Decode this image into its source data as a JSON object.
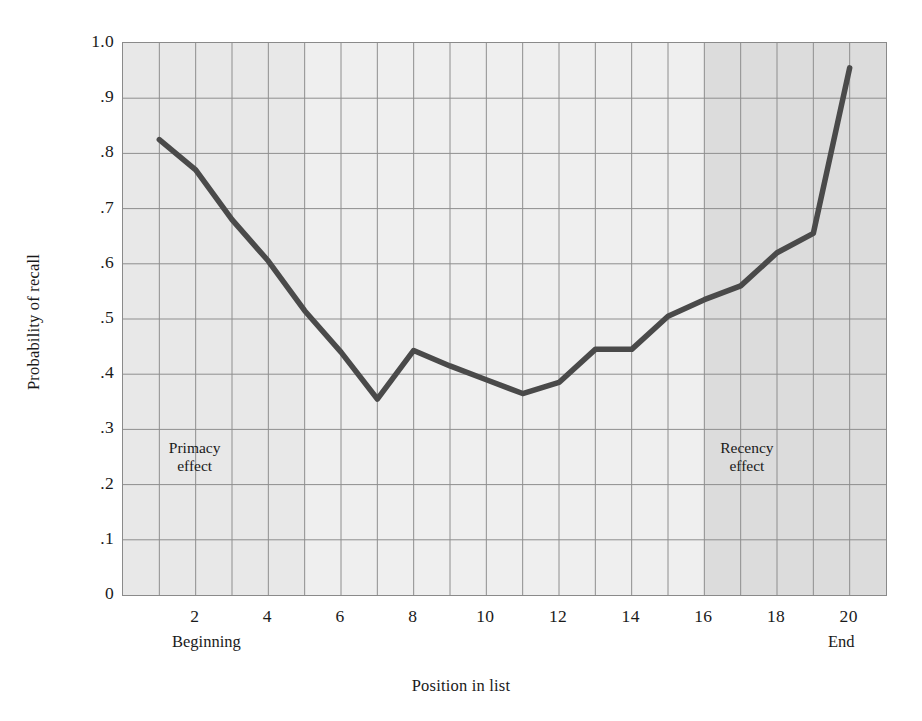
{
  "figure": {
    "background_color": "#ffffff",
    "plot_border_color": "#8a8a8a",
    "grid_color": "#8e8e8e",
    "line_color": "#4a4a4a"
  },
  "axes": {
    "y_title": "Probability of recall",
    "x_title": "Position in list",
    "y_ticks": [
      "1.0",
      ".9",
      ".8",
      ".7",
      ".6",
      ".5",
      ".4",
      ".3",
      ".2",
      ".1",
      "0"
    ],
    "y_tick_values": [
      1.0,
      0.9,
      0.8,
      0.7,
      0.6,
      0.5,
      0.4,
      0.3,
      0.2,
      0.1,
      0.0
    ],
    "x_ticks": [
      "2",
      "4",
      "6",
      "8",
      "10",
      "12",
      "14",
      "16",
      "18",
      "20"
    ],
    "x_tick_values": [
      2,
      4,
      6,
      8,
      10,
      12,
      14,
      16,
      18,
      20
    ],
    "x_start_label": "Beginning",
    "x_end_label": "End"
  },
  "annotations": [
    {
      "name": "primacy-effect",
      "text": "Primacy\neffect",
      "x": 2.0,
      "y": 0.255
    },
    {
      "name": "recency-effect",
      "text": "Recency\neffect",
      "x": 17.2,
      "y": 0.255
    }
  ],
  "bands": [
    {
      "name": "primacy-band",
      "from": 1,
      "to": 5,
      "color": "#e8e8e8"
    },
    {
      "name": "midlist-band",
      "from": 5,
      "to": 16,
      "color": "#efefef"
    },
    {
      "name": "recency-band",
      "from": 16,
      "to": 20,
      "color": "#dcdcdc"
    }
  ],
  "chart_data": {
    "type": "line",
    "title": "",
    "xlabel": "Position in list",
    "ylabel": "Probability of recall",
    "xlim": [
      0.0,
      21.0
    ],
    "ylim": [
      0.0,
      1.0
    ],
    "grid": true,
    "legend": "none",
    "x": [
      1,
      2,
      3,
      4,
      5,
      6,
      7,
      8,
      9,
      10,
      11,
      12,
      13,
      14,
      15,
      16,
      17,
      18,
      19,
      20
    ],
    "values": [
      0.825,
      0.77,
      0.68,
      0.605,
      0.515,
      0.44,
      0.355,
      0.443,
      0.415,
      0.39,
      0.365,
      0.385,
      0.445,
      0.445,
      0.505,
      0.535,
      0.56,
      0.62,
      0.655,
      0.955
    ],
    "series": [
      {
        "name": "Probability of recall",
        "x": [
          1,
          2,
          3,
          4,
          5,
          6,
          7,
          8,
          9,
          10,
          11,
          12,
          13,
          14,
          15,
          16,
          17,
          18,
          19,
          20
        ],
        "values": [
          0.825,
          0.77,
          0.68,
          0.605,
          0.515,
          0.44,
          0.355,
          0.443,
          0.415,
          0.39,
          0.365,
          0.385,
          0.445,
          0.445,
          0.505,
          0.535,
          0.56,
          0.62,
          0.655,
          0.955
        ]
      }
    ]
  }
}
